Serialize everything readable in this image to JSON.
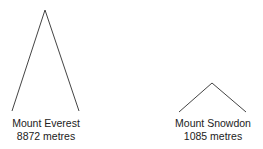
{
  "mountains": [
    {
      "name": "Mount Everest",
      "height": "8872 metres"
    },
    {
      "name": "Mount Snowdon",
      "height": "1085 metres"
    }
  ]
}
